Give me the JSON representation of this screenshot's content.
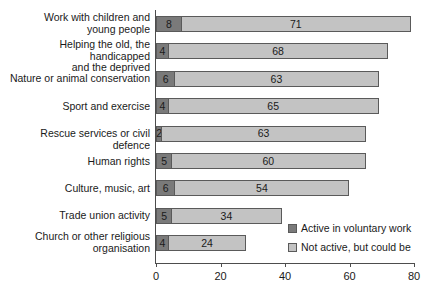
{
  "chart_data": {
    "type": "bar",
    "orientation": "horizontal",
    "stacked": true,
    "title": "",
    "xlabel": "",
    "ylabel": "",
    "xlim": [
      0,
      85
    ],
    "xticks": [
      0,
      20,
      40,
      60,
      80
    ],
    "grid": false,
    "legend_position": "inside-bottom-right",
    "categories": [
      "Work with children and\nyoung people",
      "Helping the old, the handicapped\nand the deprived",
      "Nature or animal conservation",
      "Sport and exercise",
      "Rescue services or civil defence",
      "Human rights",
      "Culture, music, art",
      "Trade union activity",
      "Church or other religious\norganisation"
    ],
    "series": [
      {
        "name": "Active in voluntary work",
        "color": "#7a7a7a",
        "values": [
          8,
          4,
          6,
          4,
          2,
          5,
          6,
          5,
          4
        ]
      },
      {
        "name": "Not active, but could be",
        "color": "#c3c3c3",
        "values": [
          71,
          68,
          63,
          65,
          63,
          60,
          54,
          34,
          24
        ]
      }
    ]
  },
  "axis": {
    "tick_labels": [
      "0",
      "20",
      "40",
      "60",
      "80"
    ]
  },
  "legend": {
    "items": [
      {
        "label": "Active in voluntary work"
      },
      {
        "label": "Not active, but could be"
      }
    ]
  }
}
